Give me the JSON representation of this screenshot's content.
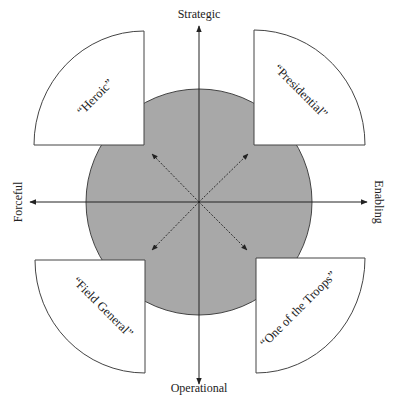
{
  "diagram": {
    "axes": {
      "top": "Strategic",
      "bottom": "Operational",
      "left": "Forceful",
      "right": "Enabling"
    },
    "quadrants": {
      "top_left": "“Heroic”",
      "top_right": "“Presidential”",
      "bottom_left": "“Field General”",
      "bottom_right": "“One of the Troops”"
    },
    "colors": {
      "circle_fill": "#a8a8a8",
      "stroke": "#333333",
      "wedge_fill": "#ffffff"
    }
  }
}
